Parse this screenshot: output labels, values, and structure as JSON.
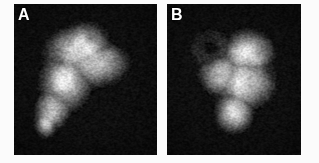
{
  "figure": {
    "name": "dual-panel-radionuclide-liver-scan",
    "background_color": "#fbfbfb",
    "width": 319,
    "height": 163,
    "modality_appearance": "greyscale scintigram, high pixel speckle noise",
    "panel_border_color": "#050505"
  },
  "panels": [
    {
      "id": "a",
      "label": "A",
      "label_color": "#ffffff",
      "frame": {
        "x": 14,
        "y": 4,
        "width": 143,
        "height": 151
      },
      "background_color": "#050505",
      "hot_region": {
        "description": "broad uniformly bright organ silhouette, wide superiorly and to the right, tapering inferolaterally to a tongue-like point at lower left",
        "peak_gray": "#f2f2ee",
        "centroid": {
          "x": 0.44,
          "y": 0.47
        },
        "notch": {
          "description": "shallow concave notch on upper right margin",
          "x": 0.7,
          "y": 0.22
        }
      },
      "cold_defect": null
    },
    {
      "id": "b",
      "label": "B",
      "label_color": "#ffffff",
      "frame": {
        "x": 167,
        "y": 4,
        "width": 134,
        "height": 151
      },
      "background_color": "#050505",
      "hot_region": {
        "description": "bright organ silhouette occupying right and inferior portion, extending lower than panel A and tapering inferiorly near midline",
        "peak_gray": "#f4f4f0",
        "centroid": {
          "x": 0.55,
          "y": 0.55
        },
        "notch": null
      },
      "cold_defect": {
        "description": "rounded photopenic (cold) area in the upper left quadrant rimmed by reduced-activity tissue",
        "center": {
          "x": 0.33,
          "y": 0.3
        },
        "radius": 0.2,
        "core_gray": "#191919"
      }
    }
  ],
  "colors": {
    "page_background": "#fbfbfb",
    "image_background": "#050505",
    "label_text": "#ffffff",
    "peak_activity": "#f3f3ef",
    "cold_defect": "#191919"
  }
}
